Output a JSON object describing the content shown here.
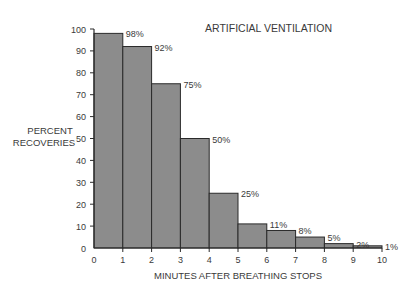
{
  "chart_data": {
    "type": "bar",
    "title": "ARTIFICIAL VENTILATION",
    "xlabel": "MINUTES AFTER BREATHING STOPS",
    "ylabel_lines": [
      "PERCENT",
      "RECOVERIES"
    ],
    "categories": [
      "0-1",
      "1-2",
      "2-3",
      "3-4",
      "4-5",
      "5-6",
      "6-7",
      "7-8",
      "8-9",
      "9-10"
    ],
    "values": [
      98,
      92,
      75,
      50,
      25,
      11,
      8,
      5,
      2,
      1
    ],
    "data_labels": [
      "98%",
      "92%",
      "75%",
      "50%",
      "25%",
      "11%",
      "8%",
      "5%",
      "2%",
      "1%"
    ],
    "x_ticks": [
      "0",
      "1",
      "2",
      "3",
      "4",
      "5",
      "6",
      "7",
      "8",
      "9",
      "10"
    ],
    "y_ticks": [
      "0",
      "10",
      "20",
      "30",
      "40",
      "50",
      "60",
      "70",
      "80",
      "90",
      "100"
    ],
    "xlim": [
      0,
      10
    ],
    "ylim": [
      0,
      100
    ],
    "grid": false,
    "legend": null,
    "colors": {
      "bar_fill": "#8c8c8c",
      "bar_edge": "#2a2a2a",
      "axis": "#2a2a2a"
    }
  }
}
